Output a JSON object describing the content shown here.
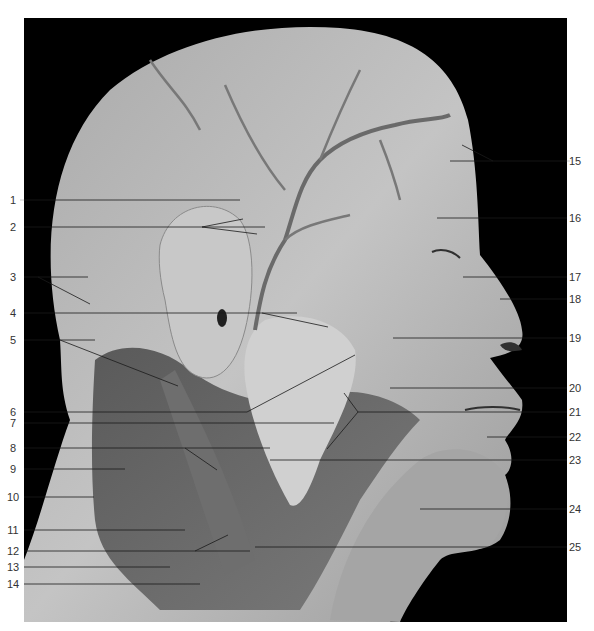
{
  "figure": {
    "background_color": "#000000",
    "specimen_tone": "#b8b8b8",
    "leader_color": "#1a1a1a",
    "label_color": "#333333"
  },
  "labels": {
    "left": [
      {
        "id": "1",
        "text": "1"
      },
      {
        "id": "2",
        "text": "2"
      },
      {
        "id": "3",
        "text": "3"
      },
      {
        "id": "4",
        "text": "4"
      },
      {
        "id": "5",
        "text": "5"
      },
      {
        "id": "6",
        "text": "6"
      },
      {
        "id": "7",
        "text": "7"
      },
      {
        "id": "8",
        "text": "8"
      },
      {
        "id": "9",
        "text": "9"
      },
      {
        "id": "10",
        "text": "10"
      },
      {
        "id": "11",
        "text": "11"
      },
      {
        "id": "12",
        "text": "12"
      },
      {
        "id": "13",
        "text": "13"
      },
      {
        "id": "14",
        "text": "14"
      }
    ],
    "right": [
      {
        "id": "15",
        "text": "15"
      },
      {
        "id": "16",
        "text": "16"
      },
      {
        "id": "17",
        "text": "17"
      },
      {
        "id": "18",
        "text": "18"
      },
      {
        "id": "19",
        "text": "19"
      },
      {
        "id": "20",
        "text": "20"
      },
      {
        "id": "21",
        "text": "21"
      },
      {
        "id": "22",
        "text": "22"
      },
      {
        "id": "23",
        "text": "23"
      },
      {
        "id": "24",
        "text": "24"
      },
      {
        "id": "25",
        "text": "25"
      }
    ]
  }
}
